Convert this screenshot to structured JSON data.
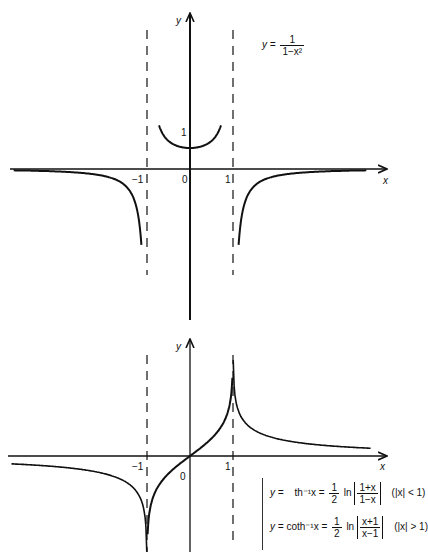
{
  "top_chart": {
    "title_formula": {
      "lhs": "y =",
      "numerator": "1",
      "denominator": "1−x²"
    },
    "axis_labels": {
      "x": "x",
      "y": "y"
    },
    "tick_labels": {
      "neg_one": "−1",
      "zero": "0",
      "one": "1",
      "y_one": "1"
    },
    "asymptotes": [
      -1,
      1
    ],
    "function": "y = 1/(1-x^2)"
  },
  "bottom_chart": {
    "axis_labels": {
      "x": "x",
      "y": "y"
    },
    "tick_labels": {
      "neg_one": "−1",
      "zero": "0",
      "one": "1"
    },
    "asymptotes": [
      -1,
      1
    ],
    "formulas": [
      {
        "lhs": "y =",
        "func": "th⁻¹x =",
        "coef_num": "1",
        "coef_den": "2",
        "ln": "ln",
        "arg_num": "1+x",
        "arg_den": "1−x",
        "condition": "(|x| < 1)"
      },
      {
        "lhs": "y =",
        "func": "coth⁻¹x =",
        "coef_num": "1",
        "coef_den": "2",
        "ln": "ln",
        "arg_num": "x+1",
        "arg_den": "x−1",
        "condition": "(|x| > 1)"
      }
    ]
  },
  "colors": {
    "ink": "#111111",
    "background": "#ffffff"
  }
}
